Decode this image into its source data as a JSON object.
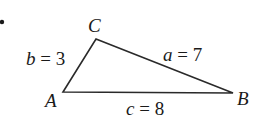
{
  "diagram": {
    "type": "triangle",
    "bullet": "•",
    "vertices": {
      "A": {
        "label": "A",
        "x": 63,
        "y": 92
      },
      "B": {
        "label": "B",
        "x": 233,
        "y": 93
      },
      "C": {
        "label": "C",
        "x": 96,
        "y": 39
      }
    },
    "sides": {
      "a": {
        "var": "a",
        "eq": " = 7",
        "between": "B-C"
      },
      "b": {
        "var": "b",
        "eq": " = 3",
        "between": "A-C"
      },
      "c": {
        "var": "c",
        "eq": " = 8",
        "between": "A-B"
      }
    },
    "colors": {
      "line": "#2a2a2a",
      "text": "#1a1a1a"
    }
  }
}
